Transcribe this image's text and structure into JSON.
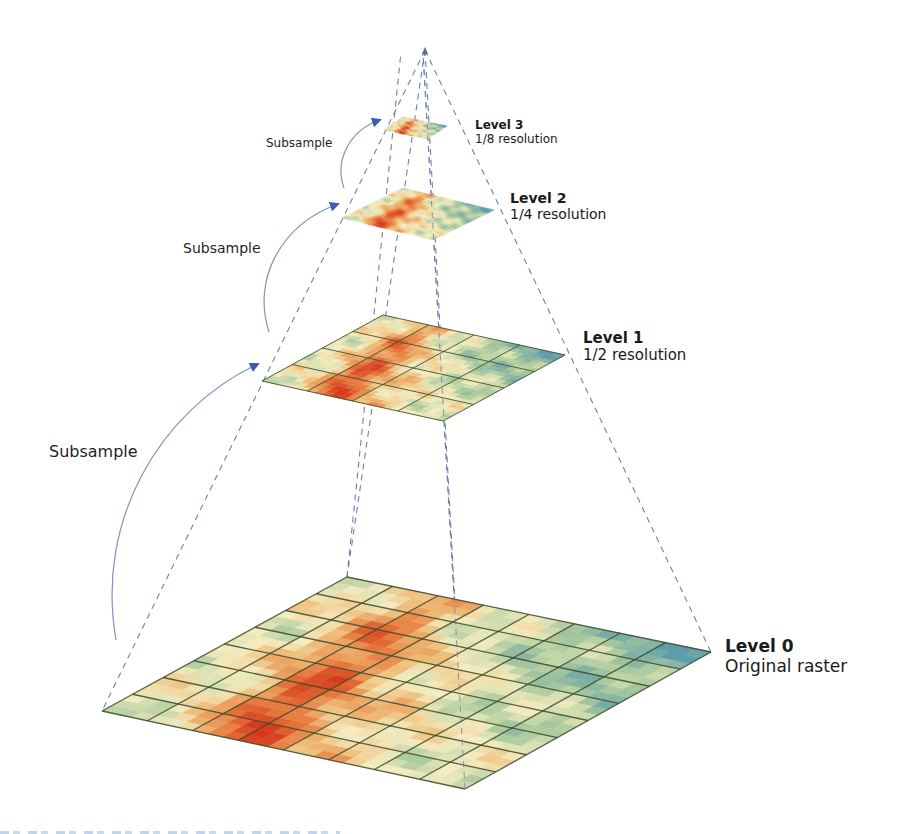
{
  "diagram": {
    "type": "raster-pyramid",
    "levels": [
      {
        "id": "level-0",
        "title": "Level 0",
        "subtitle": "Original raster",
        "grid": [
          8,
          8
        ],
        "corners": {
          "left": [
            102,
            711
          ],
          "top": [
            347,
            577
          ],
          "right": [
            711,
            652
          ],
          "bottom": [
            465,
            789
          ]
        }
      },
      {
        "id": "level-1",
        "title": "Level 1",
        "subtitle": "1/2 resolution",
        "grid": [
          4,
          4
        ],
        "corners": {
          "left": [
            262,
            381
          ],
          "top": [
            383,
            315
          ],
          "right": [
            565,
            355
          ],
          "bottom": [
            443,
            421
          ]
        }
      },
      {
        "id": "level-2",
        "title": "Level 2",
        "subtitle": "1/4 resolution",
        "grid": [
          2,
          2
        ],
        "corners": {
          "left": [
            342,
            218
          ],
          "top": [
            403,
            188
          ],
          "right": [
            494,
            210
          ],
          "bottom": [
            433,
            240
          ]
        }
      },
      {
        "id": "level-3",
        "title": "Level 3",
        "subtitle": "1/8 resolution",
        "grid": [
          1,
          1
        ],
        "corners": {
          "left": [
            384,
            130
          ],
          "top": [
            403,
            117
          ],
          "right": [
            447,
            126
          ],
          "bottom": [
            427,
            139
          ]
        }
      }
    ],
    "arrows": [
      {
        "label": "Subsample",
        "from": "level-0",
        "to": "level-1"
      },
      {
        "label": "Subsample",
        "from": "level-1",
        "to": "level-2"
      },
      {
        "label": "Subsample",
        "from": "level-2",
        "to": "level-3"
      }
    ],
    "apex": [
      425,
      50
    ],
    "colors": {
      "dashed_line": "#6f7fa8",
      "arrow": "#7f93c0",
      "arrow_head": "#3a5ea8",
      "grid_line": "#3b4a2e",
      "terrain_high": "#d9391e",
      "terrain_mid": "#f1c07a",
      "terrain_low": "#f7f2c4",
      "terrain_green": "#a7c9a0",
      "terrain_teal": "#5f9fae"
    }
  }
}
